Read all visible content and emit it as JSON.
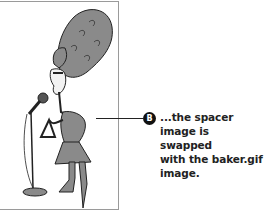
{
  "figure": {
    "illustration": "cartoon-woman-with-beehive-hair-triangle-microphone",
    "callout": {
      "badge": "B",
      "text_lines": [
        "...the spacer",
        "image is swapped",
        "with the baker.gif",
        "image."
      ]
    }
  }
}
